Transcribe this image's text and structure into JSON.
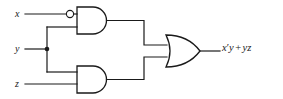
{
  "diagram": {
    "type": "logic-circuit",
    "title": "",
    "inputs": [
      {
        "id": "x",
        "label": "x",
        "y": 14
      },
      {
        "id": "y",
        "label": "y",
        "y": 49
      },
      {
        "id": "z",
        "label": "z",
        "y": 84
      }
    ],
    "gates": [
      {
        "id": "and-top",
        "type": "AND",
        "inverted_inputs": [
          "x"
        ],
        "inputs": [
          "x",
          "y"
        ],
        "output_expression": "x'y"
      },
      {
        "id": "and-bottom",
        "type": "AND",
        "inverted_inputs": [],
        "inputs": [
          "y",
          "z"
        ],
        "output_expression": "yz"
      },
      {
        "id": "or-out",
        "type": "OR",
        "inverted_inputs": [],
        "inputs": [
          "and-top",
          "and-bottom"
        ],
        "output_expression": "x'y + yz"
      }
    ],
    "output": {
      "expression_term1": "x",
      "expression_prime": "′",
      "expression_term1b": "y",
      "expression_operator": "+",
      "expression_term2": "yz",
      "full_expression": "x′y + yz"
    },
    "junctions": [
      {
        "id": "y-fanout",
        "x": 47,
        "y": 49
      }
    ],
    "colors": {
      "wire": "#1a1a1a",
      "background": "#ffffff",
      "text": "#1a1a1a"
    }
  }
}
